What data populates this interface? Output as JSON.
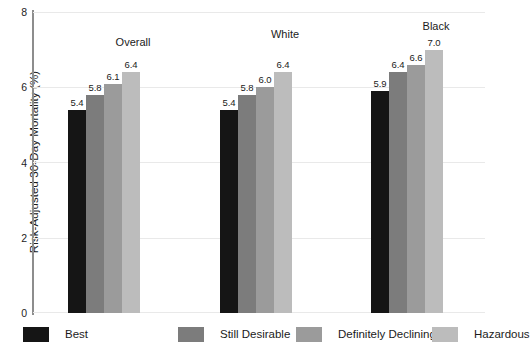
{
  "chart_data": {
    "type": "bar",
    "title": "",
    "xlabel": "",
    "ylabel": "Risk-Adjusted 30-Day Mortality (%)",
    "ylim": [
      0,
      8
    ],
    "yticks": [
      "0",
      "2",
      "4",
      "6",
      "8"
    ],
    "grid": true,
    "legend_position": "bottom",
    "categories": [
      "Overall",
      "White",
      "Black"
    ],
    "series": [
      {
        "name": "Best",
        "color": "#151515",
        "values": [
          5.4,
          5.4,
          5.9
        ],
        "labels": [
          "5.4",
          "5.4",
          "5.9"
        ]
      },
      {
        "name": "Still Desirable",
        "color": "#7c7c7c",
        "values": [
          5.8,
          5.8,
          6.4
        ],
        "labels": [
          "5.8",
          "5.8",
          "6.4"
        ]
      },
      {
        "name": "Definitely Declining",
        "color": "#9b9b9b",
        "values": [
          6.1,
          6.0,
          6.6
        ],
        "labels": [
          "6.1",
          "6.0",
          "6.6"
        ]
      },
      {
        "name": "Hazardous",
        "color": "#bcbcbc",
        "values": [
          6.4,
          6.4,
          7.0
        ],
        "labels": [
          "6.4",
          "6.4",
          "7.0"
        ]
      }
    ]
  },
  "axis": {
    "y_title": "Risk-Adjusted 30-Day Mortality (%)",
    "tick_8": "8",
    "tick_6": "6",
    "tick_4": "4",
    "tick_2": "2",
    "tick_0": "0"
  },
  "groups": {
    "overall": {
      "title": "Overall"
    },
    "white": {
      "title": "White"
    },
    "black": {
      "title": "Black"
    }
  },
  "legend": {
    "items": [
      {
        "label": "Best",
        "color": "#151515"
      },
      {
        "label": "Still Desirable",
        "color": "#7c7c7c"
      },
      {
        "label": "Definitely Declining",
        "color": "#9b9b9b"
      },
      {
        "label": "Hazardous",
        "color": "#bcbcbc"
      }
    ]
  }
}
